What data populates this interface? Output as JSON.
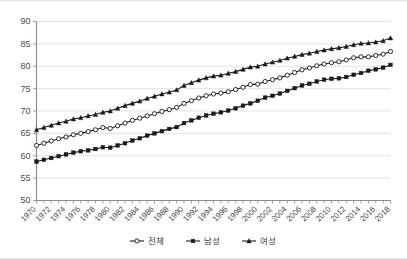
{
  "chart_data": {
    "type": "line",
    "title": "",
    "xlabel": "",
    "ylabel": "",
    "ylim": [
      50,
      90
    ],
    "ytick_step": 5,
    "yticks": [
      50,
      55,
      60,
      65,
      70,
      75,
      80,
      85,
      90
    ],
    "grid": true,
    "legend_position": "bottom",
    "x": [
      1970,
      1971,
      1972,
      1973,
      1974,
      1975,
      1976,
      1977,
      1978,
      1979,
      1980,
      1981,
      1982,
      1983,
      1984,
      1985,
      1986,
      1987,
      1988,
      1989,
      1990,
      1991,
      1992,
      1993,
      1994,
      1995,
      1996,
      1997,
      1998,
      1999,
      2000,
      2001,
      2002,
      2003,
      2004,
      2005,
      2006,
      2007,
      2008,
      2009,
      2010,
      2011,
      2012,
      2013,
      2014,
      2015,
      2016,
      2017,
      2018
    ],
    "xtick_labels": [
      "1970",
      "1972",
      "1974",
      "1976",
      "1978",
      "1980",
      "1982",
      "1984",
      "1986",
      "1988",
      "1990",
      "1992",
      "1994",
      "1996",
      "1998",
      "2000",
      "2002",
      "2004",
      "2006",
      "2008",
      "2010",
      "2012",
      "2014",
      "2016",
      "2018"
    ],
    "series": [
      {
        "name": "전체",
        "marker": "open-circle",
        "values": [
          62.3,
          62.8,
          63.3,
          63.8,
          64.2,
          64.7,
          65.0,
          65.4,
          65.8,
          66.3,
          66.1,
          66.7,
          67.3,
          67.9,
          68.4,
          68.9,
          69.4,
          69.9,
          70.3,
          70.8,
          71.7,
          72.3,
          72.9,
          73.4,
          73.8,
          74.0,
          74.3,
          74.8,
          75.3,
          75.9,
          76.0,
          76.6,
          77.0,
          77.4,
          78.0,
          78.6,
          79.2,
          79.6,
          80.1,
          80.5,
          80.8,
          81.0,
          81.4,
          81.9,
          82.1,
          82.1,
          82.4,
          82.7,
          83.3
        ]
      },
      {
        "name": "남성",
        "marker": "solid-square",
        "values": [
          58.7,
          59.1,
          59.5,
          59.9,
          60.3,
          60.7,
          61.0,
          61.2,
          61.5,
          61.9,
          61.8,
          62.3,
          62.8,
          63.4,
          63.9,
          64.5,
          65.0,
          65.5,
          66.0,
          66.4,
          67.3,
          67.9,
          68.5,
          69.0,
          69.4,
          69.7,
          70.1,
          70.6,
          71.2,
          71.7,
          72.3,
          73.0,
          73.4,
          73.9,
          74.5,
          75.1,
          75.7,
          76.1,
          76.6,
          77.0,
          77.2,
          77.3,
          77.6,
          78.1,
          78.5,
          79.0,
          79.3,
          79.7,
          80.3
        ]
      },
      {
        "name": "여성",
        "marker": "solid-triangle",
        "values": [
          65.8,
          66.3,
          66.8,
          67.3,
          67.7,
          68.2,
          68.5,
          68.9,
          69.2,
          69.7,
          70.0,
          70.6,
          71.2,
          71.7,
          72.2,
          72.8,
          73.3,
          73.8,
          74.2,
          74.7,
          75.7,
          76.3,
          76.9,
          77.4,
          77.8,
          78.0,
          78.4,
          78.8,
          79.3,
          79.8,
          80.0,
          80.5,
          80.9,
          81.3,
          81.8,
          82.2,
          82.6,
          82.9,
          83.3,
          83.6,
          83.9,
          84.1,
          84.4,
          84.8,
          85.1,
          85.2,
          85.4,
          85.7,
          86.3
        ]
      }
    ]
  },
  "legend": {
    "items": [
      {
        "label": "전체",
        "marker": "open-circle"
      },
      {
        "label": "남성",
        "marker": "solid-square"
      },
      {
        "label": "여성",
        "marker": "solid-triangle"
      }
    ]
  }
}
